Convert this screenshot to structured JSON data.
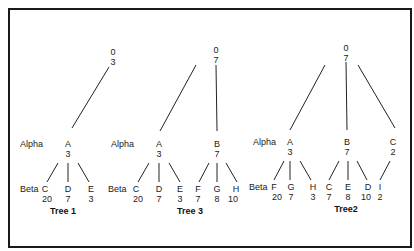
{
  "diagram": {
    "type": "tree-comparison",
    "level_labels": {
      "alpha": "Alpha",
      "beta": "Beta"
    },
    "trees": [
      {
        "title": "Tree 1",
        "root": {
          "name": "0",
          "value": "3"
        },
        "alpha": [
          {
            "name": "A",
            "value": "3"
          }
        ],
        "beta": [
          {
            "parent": "A",
            "name": "C",
            "value": "20"
          },
          {
            "parent": "A",
            "name": "D",
            "value": "7"
          },
          {
            "parent": "A",
            "name": "E",
            "value": "3"
          }
        ]
      },
      {
        "title": "Tree 3",
        "root": {
          "name": "0",
          "value": "7"
        },
        "alpha": [
          {
            "name": "A",
            "value": "3"
          },
          {
            "name": "B",
            "value": "7"
          }
        ],
        "beta": [
          {
            "parent": "A",
            "name": "C",
            "value": "20"
          },
          {
            "parent": "A",
            "name": "D",
            "value": "7"
          },
          {
            "parent": "A",
            "name": "E",
            "value": "3"
          },
          {
            "parent": "B",
            "name": "F",
            "value": "7"
          },
          {
            "parent": "B",
            "name": "G",
            "value": "8"
          },
          {
            "parent": "B",
            "name": "H",
            "value": "10"
          }
        ]
      },
      {
        "title": "Tree2",
        "root": {
          "name": "0",
          "value": "7"
        },
        "alpha": [
          {
            "name": "A",
            "value": "3"
          },
          {
            "name": "B",
            "value": "7"
          },
          {
            "name": "C",
            "value": "2"
          }
        ],
        "beta": [
          {
            "parent": "A",
            "name": "F",
            "value": "20"
          },
          {
            "parent": "A",
            "name": "G",
            "value": "7"
          },
          {
            "parent": "A",
            "name": "H",
            "value": "3"
          },
          {
            "parent": "B",
            "name": "C",
            "value": "7"
          },
          {
            "parent": "B",
            "name": "E",
            "value": "8"
          },
          {
            "parent": "B",
            "name": "D",
            "value": "10"
          },
          {
            "parent": "C",
            "name": "I",
            "value": "2"
          }
        ]
      }
    ]
  }
}
